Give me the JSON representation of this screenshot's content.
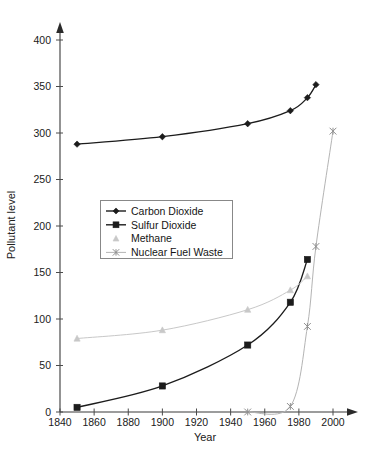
{
  "chart_data": {
    "type": "line",
    "title": "",
    "xlabel": "Year",
    "ylabel": "Pollutant level",
    "xlim": [
      1840,
      2010
    ],
    "ylim": [
      0,
      415
    ],
    "xticks": [
      1840,
      1860,
      1880,
      1900,
      1920,
      1940,
      1960,
      1980,
      2000
    ],
    "yticks": [
      0,
      50,
      100,
      150,
      200,
      250,
      300,
      350,
      400
    ],
    "grid": false,
    "legend_position": "center-left",
    "series": [
      {
        "name": "Carbon Dioxide",
        "marker": "diamond",
        "color": "#1c1c1c",
        "x": [
          1850,
          1900,
          1950,
          1975,
          1985,
          1990
        ],
        "values": [
          288,
          296,
          310,
          324,
          338,
          352
        ]
      },
      {
        "name": "Sulfur Dioxide",
        "marker": "square",
        "color": "#1c1c1c",
        "x": [
          1850,
          1900,
          1950,
          1975,
          1985
        ],
        "values": [
          5,
          28,
          72,
          118,
          164
        ]
      },
      {
        "name": "Methane",
        "marker": "triangle",
        "color": "#c8c8c8",
        "x": [
          1850,
          1900,
          1950,
          1975,
          1985
        ],
        "values": [
          79,
          88,
          110,
          131,
          146
        ]
      },
      {
        "name": "Nuclear Fuel Waste",
        "marker": "star",
        "color": "#b4b4b4",
        "x": [
          1950,
          1975,
          1985,
          1990,
          2000
        ],
        "values": [
          0,
          6,
          92,
          178,
          302
        ]
      }
    ]
  },
  "axes": {
    "x_title": "Year",
    "y_title": "Pollutant level",
    "x_tick_labels": [
      "1840",
      "1860",
      "1880",
      "1900",
      "1920",
      "1940",
      "1960",
      "1980",
      "2000"
    ],
    "y_tick_labels": [
      "0",
      "50",
      "100",
      "150",
      "200",
      "250",
      "300",
      "350",
      "400"
    ]
  },
  "legend": {
    "entries": [
      {
        "label": "Carbon Dioxide",
        "marker": "diamond",
        "color": "#1c1c1c"
      },
      {
        "label": "Sulfur Dioxide",
        "marker": "square",
        "color": "#1c1c1c"
      },
      {
        "label": "Methane",
        "marker": "triangle",
        "color": "#c8c8c8"
      },
      {
        "label": "Nuclear Fuel Waste",
        "marker": "star",
        "color": "#b4b4b4"
      }
    ]
  }
}
